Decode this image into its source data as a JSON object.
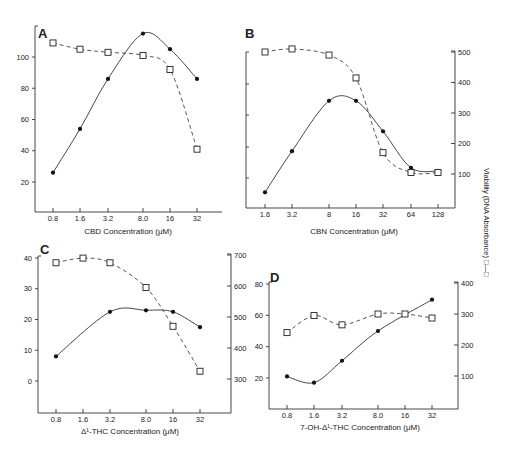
{
  "figure": {
    "right_axis_title": "Viability (DNA Absorbance) □—□",
    "legend_symbols": {
      "dna_synthesis": "filled circle — solid line",
      "viability": "open square — dashed line"
    }
  },
  "chart_data": [
    {
      "type": "line",
      "panel": "A",
      "title": "A",
      "xlabel": "CBD Concentration (μM)",
      "ylabel": "",
      "x": [
        "0.8",
        "1.6",
        "3.2",
        "8.0",
        "16",
        "32"
      ],
      "left_ticks": [
        "20",
        "40",
        "60",
        "80",
        "100"
      ],
      "ylim": [
        0,
        120
      ],
      "right_ticks": [],
      "series": [
        {
          "name": "filled circles (solid)",
          "axis": "left",
          "values": [
            26,
            54,
            86,
            115,
            105,
            86
          ]
        },
        {
          "name": "open squares (dashed)",
          "axis": "left",
          "values": [
            109,
            105,
            103,
            101,
            92,
            41
          ]
        }
      ]
    },
    {
      "type": "line",
      "panel": "B",
      "title": "B",
      "xlabel": "CBN Concentration (μM)",
      "x": [
        "1.6",
        "3.2",
        "8",
        "16",
        "32",
        "64",
        "128"
      ],
      "left_ticks": [],
      "right_ticks": [
        "100",
        "200",
        "300",
        "400",
        "500"
      ],
      "ylim_right": [
        0,
        520
      ],
      "series": [
        {
          "name": "filled circles (solid)",
          "axis": "right",
          "values": [
            40,
            175,
            340,
            340,
            240,
            120,
            110
          ]
        },
        {
          "name": "open squares (dashed)",
          "axis": "right",
          "values": [
            500,
            510,
            490,
            415,
            170,
            105,
            105
          ]
        }
      ]
    },
    {
      "type": "line",
      "panel": "C",
      "title": "C",
      "xlabel": "Δ¹-THC Concentration (μM)",
      "x": [
        "0.8",
        "1.6",
        "3.2",
        "8.0",
        "16",
        "32"
      ],
      "left_ticks": [
        "0",
        "10",
        "20",
        "30",
        "40"
      ],
      "ylim": [
        -10,
        40
      ],
      "right_ticks": [
        "300",
        "400",
        "500",
        "600",
        "700"
      ],
      "ylim_right": [
        200,
        700
      ],
      "series": [
        {
          "name": "filled circles (solid)",
          "axis": "left",
          "values": [
            8,
            null,
            22.5,
            23,
            22.5,
            17.5
          ]
        },
        {
          "name": "open squares (dashed)",
          "axis": "right",
          "values": [
            675,
            690,
            675,
            595,
            470,
            325
          ]
        }
      ]
    },
    {
      "type": "line",
      "panel": "D",
      "title": "D",
      "xlabel": "7-OH-Δ¹-THC Concentration (μM)",
      "x": [
        "0.8",
        "1.6",
        "3.2",
        "8.0",
        "16",
        "32"
      ],
      "left_ticks": [
        "20",
        "40",
        "60",
        "80"
      ],
      "ylim": [
        0,
        80
      ],
      "right_ticks": [
        "100",
        "200",
        "300",
        "400"
      ],
      "ylim_right": [
        0,
        400
      ],
      "series": [
        {
          "name": "filled circles (solid)",
          "axis": "left",
          "values": [
            21,
            17,
            31,
            50,
            null,
            70
          ]
        },
        {
          "name": "open squares (dashed)",
          "axis": "right",
          "values": [
            240,
            295,
            265,
            300,
            300,
            287
          ]
        }
      ]
    }
  ]
}
